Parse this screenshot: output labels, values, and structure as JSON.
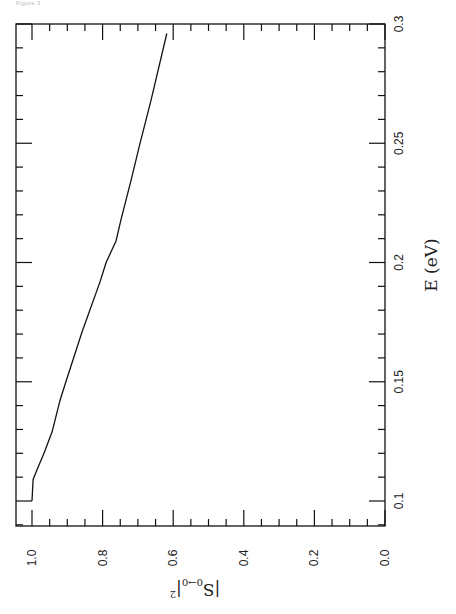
{
  "figure": {
    "caption": "Figure 3"
  },
  "chart_data": {
    "type": "line",
    "title": "",
    "orientation": "rotated 90° (E axis runs vertically on right side, |S|^2 axis horizontally along bottom)",
    "xlabel": "E (eV)",
    "ylabel": "|S0→0|²",
    "ylabel_parts": {
      "main": "|S",
      "sub": "0→0",
      "close": "|",
      "sup": "2"
    },
    "xlim": [
      0.1,
      0.3
    ],
    "ylim": [
      0.0,
      1.05
    ],
    "x_ticks": [
      "0.1",
      "0.15",
      "0.2",
      "0.25",
      "0.3"
    ],
    "y_ticks": [
      "0.0",
      "0.2",
      "0.4",
      "0.6",
      "0.8",
      "1.0"
    ],
    "grid": false,
    "legend": null,
    "series": [
      {
        "name": "|S0→0|²",
        "x": [
          0.1,
          0.109,
          0.113,
          0.12,
          0.129,
          0.142,
          0.15,
          0.171,
          0.192,
          0.2,
          0.209,
          0.211,
          0.218,
          0.234,
          0.25,
          0.268,
          0.296
        ],
        "values": [
          1.0,
          0.997,
          0.986,
          0.966,
          0.943,
          0.921,
          0.904,
          0.858,
          0.807,
          0.79,
          0.762,
          0.759,
          0.748,
          0.72,
          0.694,
          0.663,
          0.618
        ]
      }
    ]
  }
}
